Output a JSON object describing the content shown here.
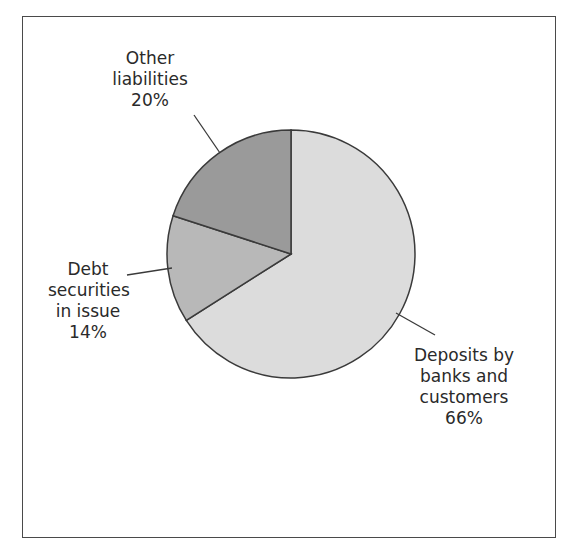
{
  "chart_data": {
    "type": "pie",
    "title": "",
    "categories": [
      "Deposits by banks and customers",
      "Debt securities in issue",
      "Other liabilities"
    ],
    "values": [
      66,
      14,
      20
    ],
    "unit": "%",
    "colors": [
      "#dcdcdc",
      "#b8b8b8",
      "#9a9a9a"
    ],
    "start_angle": "12 o'clock",
    "direction": "clockwise",
    "legend": "none (direct labels with leader lines)"
  },
  "labels": {
    "other": {
      "line1": "Other",
      "line2": "liabilities",
      "pct": "20%"
    },
    "debt": {
      "line1": "Debt",
      "line2": "securities",
      "line3": "in issue",
      "pct": "14%"
    },
    "deposits": {
      "line1": "Deposits by",
      "line2": "banks and",
      "line3": "customers",
      "pct": "66%"
    }
  }
}
